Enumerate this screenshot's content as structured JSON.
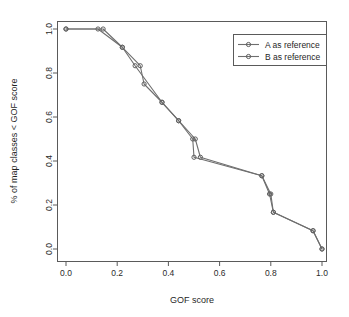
{
  "chart_data": {
    "type": "line",
    "title": "",
    "xlabel": "GOF score",
    "ylabel": "% of map classes < GOF score",
    "xlim": [
      0.0,
      1.0
    ],
    "ylim": [
      0.0,
      1.0
    ],
    "xticks": [
      "0.0",
      "0.2",
      "0.4",
      "0.6",
      "0.8",
      "1.0"
    ],
    "xtick_values": [
      0.0,
      0.2,
      0.4,
      0.6,
      0.8,
      1.0
    ],
    "yticks": [
      "0.0",
      "0.2",
      "0.4",
      "0.6",
      "0.8",
      "1.0"
    ],
    "ytick_values": [
      0.0,
      0.2,
      0.4,
      0.6,
      0.8,
      1.0
    ],
    "grid": false,
    "legend_position": "top-right",
    "marker": "open-circle",
    "series": [
      {
        "name": "A as reference",
        "color": "#6e6e6e",
        "x": [
          0.0,
          0.125,
          0.22,
          0.27,
          0.375,
          0.44,
          0.495,
          0.5,
          0.765,
          0.795,
          0.81,
          0.965,
          1.0
        ],
        "y": [
          1.0,
          1.0,
          0.917,
          0.833,
          0.667,
          0.583,
          0.5,
          0.417,
          0.333,
          0.25,
          0.167,
          0.083,
          0.0
        ]
      },
      {
        "name": "B as reference",
        "color": "#6e6e6e",
        "x": [
          0.0,
          0.145,
          0.22,
          0.29,
          0.305,
          0.375,
          0.44,
          0.505,
          0.525,
          0.765,
          0.8,
          0.81,
          0.965,
          1.0
        ],
        "y": [
          1.0,
          1.0,
          0.917,
          0.833,
          0.75,
          0.667,
          0.583,
          0.5,
          0.417,
          0.333,
          0.25,
          0.167,
          0.083,
          0.0
        ]
      }
    ]
  },
  "legend": {
    "items": [
      {
        "label": "A as reference"
      },
      {
        "label": "B as reference"
      }
    ]
  },
  "axes": {
    "x_title": "GOF score",
    "y_title": "% of map classes < GOF score"
  }
}
